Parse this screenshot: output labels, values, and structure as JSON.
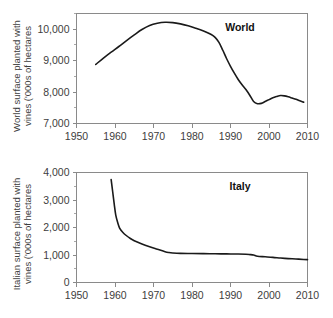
{
  "figure": {
    "name": "world-and-italy-vineyard-surface-figure",
    "background_color": "#ffffff",
    "line_color": "#1a1a1a",
    "axis_color": "#8a8a8a"
  },
  "chart_data": [
    {
      "type": "line",
      "id": "world",
      "title": "World",
      "xlabel": "",
      "ylabel_line1": "World surface planted with",
      "ylabel_line2": "vines ('000s of hectares",
      "xlim": [
        1950,
        2010
      ],
      "ylim": [
        7000,
        10500
      ],
      "xticks": [
        1950,
        1960,
        1970,
        1980,
        1990,
        2000,
        2010
      ],
      "xtick_labels": [
        "1950",
        "1960",
        "1970",
        "1980",
        "1990",
        "2000",
        "2010"
      ],
      "yticks": [
        7000,
        8000,
        9000,
        10000
      ],
      "ytick_labels": [
        "7,000",
        "8,000",
        "9,000",
        "10,000"
      ],
      "yticks_minor": [
        7500,
        8500,
        9500,
        10500
      ],
      "grid": false,
      "legend": "none",
      "series": [
        {
          "name": "World surface planted with vines",
          "x": [
            1955,
            1957,
            1959,
            1961,
            1963,
            1965,
            1967,
            1969,
            1971,
            1973,
            1975,
            1977,
            1979,
            1981,
            1983,
            1985,
            1986,
            1987,
            1988,
            1989,
            1990,
            1991,
            1992,
            1993,
            1994,
            1995,
            1996,
            1997,
            1998,
            1999,
            2000,
            2001,
            2002,
            2003,
            2004,
            2005,
            2006,
            2007,
            2008,
            2009
          ],
          "y": [
            8880,
            9080,
            9270,
            9450,
            9640,
            9820,
            9990,
            10120,
            10190,
            10220,
            10210,
            10170,
            10110,
            10030,
            9940,
            9830,
            9740,
            9580,
            9330,
            9060,
            8820,
            8600,
            8400,
            8230,
            8080,
            7900,
            7700,
            7630,
            7640,
            7700,
            7760,
            7820,
            7860,
            7890,
            7880,
            7850,
            7810,
            7770,
            7720,
            7680
          ]
        }
      ]
    },
    {
      "type": "line",
      "id": "italy",
      "title": "Italy",
      "xlabel": "",
      "ylabel_line1": "Italian surface planted with",
      "ylabel_line2": "vines ('000s of hectares",
      "xlim": [
        1950,
        2010
      ],
      "ylim": [
        0,
        4000
      ],
      "xticks": [
        1950,
        1960,
        1970,
        1980,
        1990,
        2000,
        2010
      ],
      "xtick_labels": [
        "1950",
        "1960",
        "1970",
        "1980",
        "1990",
        "2000",
        "2010"
      ],
      "yticks": [
        0,
        1000,
        2000,
        3000,
        4000
      ],
      "ytick_labels": [
        "0",
        "1,000",
        "2,000",
        "3,000",
        "4,000"
      ],
      "yticks_minor": [
        500,
        1500,
        2500,
        3500
      ],
      "grid": false,
      "legend": "none",
      "series": [
        {
          "name": "Italian surface planted with vines",
          "x": [
            1959,
            1959.4,
            1959.8,
            1960.2,
            1960.7,
            1961.2,
            1962,
            1963,
            1964,
            1965,
            1967,
            1969,
            1971,
            1973,
            1974,
            1975,
            1977,
            1980,
            1983,
            1986,
            1989,
            1992,
            1994,
            1995,
            1996,
            1997,
            1999,
            2001,
            2003,
            2005,
            2007,
            2009,
            2010
          ],
          "y": [
            3740,
            3300,
            2850,
            2450,
            2180,
            1980,
            1830,
            1700,
            1600,
            1520,
            1400,
            1300,
            1210,
            1120,
            1090,
            1075,
            1060,
            1055,
            1050,
            1045,
            1040,
            1035,
            1025,
            1015,
            1000,
            955,
            935,
            915,
            890,
            870,
            855,
            838,
            830
          ]
        }
      ]
    }
  ]
}
